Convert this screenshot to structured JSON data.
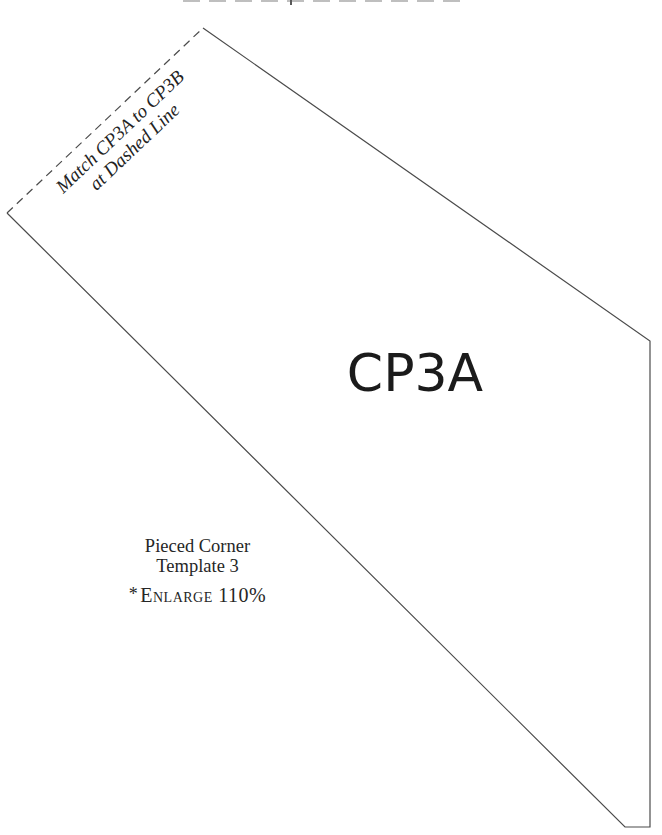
{
  "colors": {
    "background": "#ffffff",
    "line": "#4b4b4b",
    "label_text": "#1b1b1b",
    "serif_text": "#262626"
  },
  "shape": {
    "label": "CP3A",
    "solid_vertices": [
      [
        203,
        28
      ],
      [
        650,
        341
      ],
      [
        650,
        827
      ],
      [
        625,
        827
      ],
      [
        7,
        213
      ]
    ],
    "dashed_edge": {
      "from": [
        7,
        213
      ],
      "to": [
        203,
        28
      ]
    },
    "dash_pattern": "8 5.5"
  },
  "match_note": {
    "line1": "Match CP3A to CP3B",
    "line2": "at Dashed Line"
  },
  "info": {
    "title_line1": "Pieced Corner",
    "title_line2": "Template 3",
    "enlarge_star": "*",
    "enlarge_label": "Enlarge 110%"
  }
}
